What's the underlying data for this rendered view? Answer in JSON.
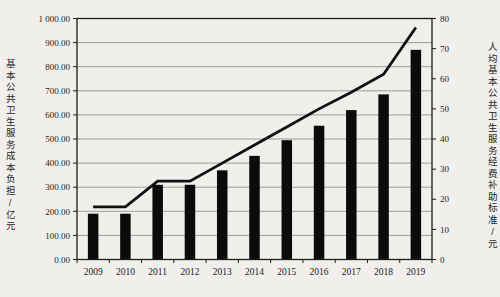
{
  "figure": {
    "background_color": "#f1efec",
    "bar_color": "#0b0b0b",
    "line_color": "#101010",
    "frame_color": "#1c1c1c",
    "grid_color": "#787878"
  },
  "chart_data": {
    "type": "bar+line",
    "title": "",
    "categories": [
      "2009",
      "2010",
      "2011",
      "2012",
      "2013",
      "2014",
      "2015",
      "2016",
      "2017",
      "2018",
      "2019"
    ],
    "series": [
      {
        "name": "基本公共卫生服务成本负担",
        "type": "bar",
        "axis": "left",
        "values": [
          190,
          190,
          310,
          310,
          370,
          430,
          495,
          555,
          620,
          685,
          870
        ]
      },
      {
        "name": "人均基本公共卫生服务经费补助标准",
        "type": "line",
        "axis": "right",
        "values": [
          17.5,
          17.5,
          26,
          26,
          32,
          38,
          44,
          50,
          55.5,
          61.5,
          77
        ]
      }
    ],
    "ylabel_left": "基本公共卫生服务成本负担/亿元",
    "ylabel_right": "人均基本公共卫生服务经费补助标准/元",
    "xlabel": "",
    "left_axis": {
      "min": 0,
      "max": 1000,
      "step": 100,
      "tick_labels": [
        "0.00",
        "100.00",
        "200.00",
        "300.00",
        "400.00",
        "500.00",
        "600.00",
        "700.00",
        "800.00",
        "900.00",
        "1 000.00"
      ]
    },
    "right_axis": {
      "min": 0,
      "max": 80,
      "step": 10,
      "tick_labels": [
        "0",
        "10",
        "20",
        "30",
        "40",
        "50",
        "60",
        "70",
        "80"
      ]
    },
    "grid": true,
    "legend_position": "none"
  }
}
